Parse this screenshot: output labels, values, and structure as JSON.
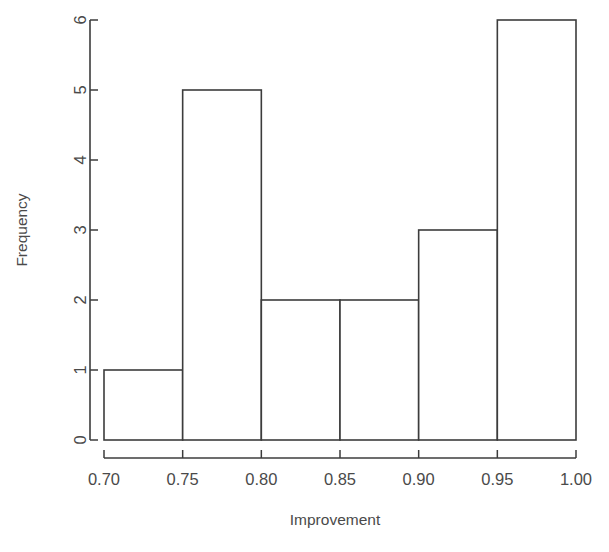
{
  "chart_data": {
    "type": "bar",
    "title": "",
    "subtitle": "",
    "xlabel": "Improvement",
    "ylabel": "Frequency",
    "bin_edges": [
      0.7,
      0.75,
      0.8,
      0.85,
      0.9,
      0.95,
      1.0
    ],
    "categories": [
      "0.70-0.75",
      "0.75-0.80",
      "0.80-0.85",
      "0.85-0.90",
      "0.90-0.95",
      "0.95-1.00"
    ],
    "values": [
      1,
      5,
      2,
      2,
      3,
      6
    ],
    "bin_width": 0.05,
    "xlim": [
      0.7,
      1.0
    ],
    "ylim": [
      0,
      6
    ],
    "xticks": [
      0.7,
      0.75,
      0.8,
      0.85,
      0.9,
      0.95,
      1.0
    ],
    "xtick_labels": [
      "0.70",
      "0.75",
      "0.80",
      "0.85",
      "0.90",
      "0.95",
      "1.00"
    ],
    "yticks": [
      0,
      1,
      2,
      3,
      4,
      5,
      6
    ],
    "ytick_labels": [
      "0",
      "1",
      "2",
      "3",
      "4",
      "5",
      "6"
    ],
    "grid": false,
    "legend": null,
    "bar_fill": "#ffffff",
    "bar_stroke": "#3c3c3c",
    "total_count": 19,
    "ytick_label_rotation": 90,
    "ylabel_rotation": 90
  },
  "axes": {
    "x_title": "Improvement",
    "y_title": "Frequency"
  }
}
